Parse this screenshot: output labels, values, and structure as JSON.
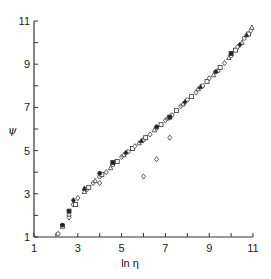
{
  "chart_data": {
    "type": "scatter",
    "title": "",
    "xlabel": "ln η",
    "ylabel": "ψ",
    "xlim": [
      1,
      11
    ],
    "ylim": [
      1,
      11
    ],
    "grid": false,
    "legend": null,
    "x_ticks_major": [
      1,
      3,
      5,
      7,
      9,
      11
    ],
    "x_ticks_minor": [
      2,
      4,
      6,
      8,
      10
    ],
    "y_ticks_major": [
      1,
      3,
      5,
      7,
      9,
      11
    ],
    "y_ticks_minor": [
      2,
      4,
      6,
      8,
      10
    ],
    "x_tick_labels": [
      "1",
      "3",
      "5",
      "7",
      "9",
      "11"
    ],
    "y_tick_labels": [
      "1",
      "3",
      "5",
      "7",
      "9",
      "11"
    ],
    "series": [
      {
        "name": "open-symbols",
        "marker": "open",
        "points": [
          [
            2.1,
            1.15
          ],
          [
            2.3,
            1.5
          ],
          [
            2.6,
            1.9
          ],
          [
            2.6,
            2.05
          ],
          [
            2.8,
            2.5
          ],
          [
            2.9,
            2.5
          ],
          [
            3.0,
            2.8
          ],
          [
            3.3,
            3.1
          ],
          [
            3.4,
            3.2
          ],
          [
            3.5,
            3.3
          ],
          [
            3.7,
            3.5
          ],
          [
            3.8,
            3.6
          ],
          [
            4.0,
            3.8
          ],
          [
            4.1,
            3.9
          ],
          [
            4.3,
            4.0
          ],
          [
            4.5,
            4.2
          ],
          [
            4.6,
            4.35
          ],
          [
            4.8,
            4.5
          ],
          [
            5.0,
            4.7
          ],
          [
            5.1,
            4.8
          ],
          [
            5.3,
            4.95
          ],
          [
            5.5,
            5.1
          ],
          [
            5.6,
            5.2
          ],
          [
            5.8,
            5.35
          ],
          [
            6.0,
            5.5
          ],
          [
            6.1,
            5.6
          ],
          [
            6.3,
            5.75
          ],
          [
            6.5,
            5.95
          ],
          [
            6.6,
            6.05
          ],
          [
            6.8,
            6.2
          ],
          [
            7.0,
            6.4
          ],
          [
            7.1,
            6.5
          ],
          [
            7.3,
            6.65
          ],
          [
            7.5,
            6.85
          ],
          [
            7.7,
            7.05
          ],
          [
            7.8,
            7.15
          ],
          [
            8.0,
            7.35
          ],
          [
            8.2,
            7.5
          ],
          [
            8.4,
            7.7
          ],
          [
            8.5,
            7.85
          ],
          [
            8.7,
            8.0
          ],
          [
            8.9,
            8.2
          ],
          [
            9.0,
            8.35
          ],
          [
            9.2,
            8.5
          ],
          [
            9.4,
            8.7
          ],
          [
            9.5,
            8.85
          ],
          [
            9.7,
            9.05
          ],
          [
            9.9,
            9.3
          ],
          [
            10.0,
            9.4
          ],
          [
            10.2,
            9.65
          ],
          [
            10.3,
            9.8
          ],
          [
            10.5,
            10.0
          ],
          [
            10.6,
            10.2
          ],
          [
            10.8,
            10.4
          ],
          [
            10.9,
            10.55
          ],
          [
            10.95,
            10.7
          ]
        ]
      },
      {
        "name": "filled-symbols",
        "marker": "filled",
        "points": [
          [
            2.3,
            1.55
          ],
          [
            2.6,
            2.2
          ],
          [
            2.8,
            2.7
          ],
          [
            3.3,
            3.25
          ],
          [
            4.0,
            3.95
          ],
          [
            4.6,
            4.45
          ],
          [
            5.2,
            4.9
          ],
          [
            5.9,
            5.45
          ],
          [
            6.6,
            6.1
          ],
          [
            7.2,
            6.55
          ],
          [
            7.9,
            7.25
          ],
          [
            8.6,
            7.95
          ],
          [
            9.3,
            8.65
          ],
          [
            10.0,
            9.5
          ],
          [
            10.4,
            9.9
          ],
          [
            10.7,
            10.35
          ]
        ]
      },
      {
        "name": "outliers",
        "marker": "open",
        "points": [
          [
            4.0,
            3.5
          ],
          [
            6.0,
            3.8
          ],
          [
            6.6,
            4.6
          ],
          [
            7.2,
            5.6
          ]
        ]
      }
    ]
  }
}
